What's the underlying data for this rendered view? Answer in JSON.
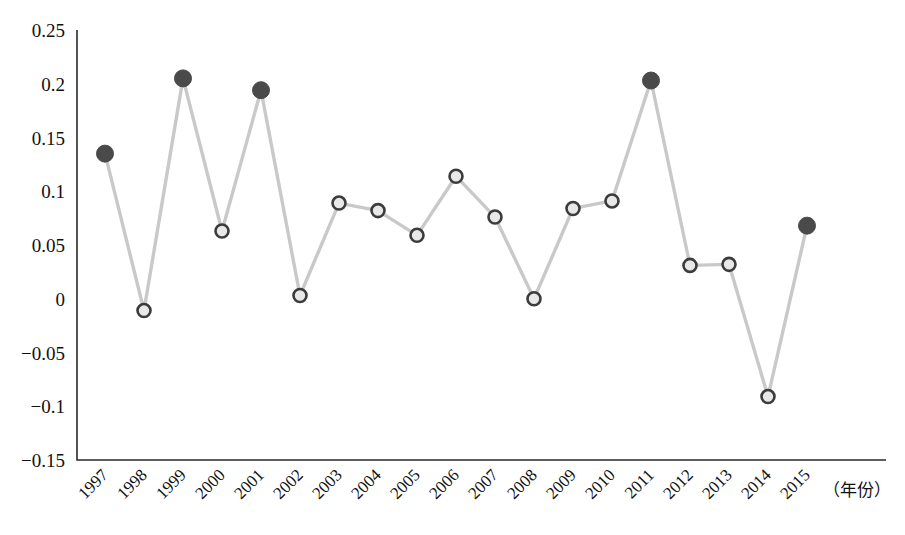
{
  "chart_data": {
    "type": "line",
    "title": "",
    "subtitle": "",
    "xlabel": "（年份）",
    "ylabel": "",
    "categories": [
      "1997",
      "1998",
      "1999",
      "2000",
      "2001",
      "2002",
      "2003",
      "2004",
      "2005",
      "2006",
      "2007",
      "2008",
      "2009",
      "2010",
      "2011",
      "2012",
      "2013",
      "2014",
      "2015"
    ],
    "values": [
      0.135,
      -0.011,
      0.205,
      0.063,
      0.194,
      0.003,
      0.089,
      0.082,
      0.059,
      0.114,
      0.076,
      0.0,
      0.084,
      0.091,
      0.203,
      0.031,
      0.032,
      -0.091,
      0.068
    ],
    "marker_styles": [
      "filled",
      "hollow",
      "filled",
      "hollow",
      "filled",
      "hollow",
      "hollow",
      "hollow",
      "hollow",
      "hollow",
      "hollow",
      "hollow",
      "hollow",
      "hollow",
      "filled",
      "hollow",
      "hollow",
      "hollow",
      "filled"
    ],
    "ylim": [
      -0.15,
      0.25
    ],
    "yticks": [
      "0.25",
      "0.2",
      "0.15",
      "0.1",
      "0.05",
      "0",
      "−0.05",
      "−0.1",
      "−0.15"
    ],
    "ytick_values": [
      0.25,
      0.2,
      0.15,
      0.1,
      0.05,
      0,
      -0.05,
      -0.1,
      -0.15
    ],
    "xtick_rotation_deg": -45,
    "grid": false,
    "legend": "none",
    "series": [
      {
        "name": "",
        "values": [
          0.135,
          -0.011,
          0.205,
          0.063,
          0.194,
          0.003,
          0.089,
          0.082,
          0.059,
          0.114,
          0.076,
          0.0,
          0.084,
          0.091,
          0.203,
          0.031,
          0.032,
          -0.091,
          0.068
        ]
      }
    ]
  },
  "colors": {
    "line": "#c9c9c9",
    "marker_fill_dark": "#4a4a4a",
    "marker_hollow_stroke": "#3c3c3c",
    "marker_hollow_fill": "#e8e8e8",
    "axis": "#2b2b2b",
    "text": "#111111",
    "background": "#ffffff"
  }
}
